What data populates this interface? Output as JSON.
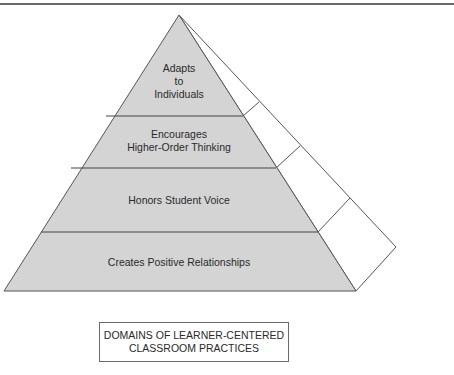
{
  "diagram": {
    "type": "pyramid",
    "levels": [
      {
        "line1": "Adapts",
        "line2": "to",
        "line3": "Individuals"
      },
      {
        "line1": "Encourages",
        "line2": "Higher-Order Thinking"
      },
      {
        "line1": "Honors Student Voice"
      },
      {
        "line1": "Creates Positive Relationships"
      }
    ],
    "caption": {
      "line1": "DOMAINS OF LEARNER-CENTERED",
      "line2": "CLASSROOM PRACTICES"
    },
    "colors": {
      "front_fill": "#d4d4d4",
      "side_fill": "#ffffff",
      "stroke": "#555555"
    }
  }
}
